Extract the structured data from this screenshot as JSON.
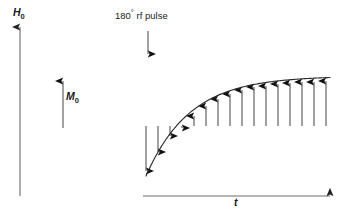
{
  "figure": {
    "kind": "nmr-inversion-recovery-diagram",
    "background_color": "#ffffff",
    "ink_color": "#1a1a1a",
    "shaft_color": "#555555",
    "axis_color": "#6b6b6b",
    "curve_color": "#2b2b2b",
    "labels": {
      "y_axis": "H",
      "y_axis_sub": "0",
      "magnetization": "M",
      "magnetization_sub": "0",
      "x_axis": "t",
      "pulse_prefix": "180",
      "pulse_degree": "°",
      "pulse_suffix": " rf pulse"
    }
  },
  "chart_data": {
    "type": "line",
    "title": "",
    "subtitle": "",
    "xlabel": "t",
    "ylabel": "H0",
    "grid": false,
    "legend": "none",
    "annotations": [
      {
        "text": "H0",
        "role": "y-axis-label",
        "x": 20,
        "y": 14
      },
      {
        "text": "M0",
        "role": "equilibrium-magnetization-label",
        "x": 72,
        "y": 96
      },
      {
        "text": "180° rf pulse",
        "role": "pulse-label",
        "x": 150,
        "y": 16
      },
      {
        "text": "t",
        "role": "x-axis-label",
        "x": 237,
        "y": 203
      }
    ],
    "axes": {
      "y_axis": {
        "x": 20,
        "y_bottom": 196,
        "y_top": 25,
        "arrow": "up"
      },
      "x_axis": {
        "y": 196,
        "x_left": 143,
        "x_right": 332,
        "arrow": "right"
      }
    },
    "reference_vector": {
      "name": "M0",
      "x": 63,
      "y_base": 128,
      "y_tip": 79,
      "direction": "up",
      "length_px": 49
    },
    "pulse_marker": {
      "name": "180-degree-rf-pulse",
      "x": 148,
      "y_top": 31,
      "y_tip": 56,
      "direction": "down"
    },
    "curve": {
      "description": "T1 inversion recovery: Mz(t) = M0 (1 - 2 exp(-t/T1))",
      "x_start": 146,
      "x_end": 330,
      "y_start": 176,
      "y_asymptote": 76,
      "equilibrium_level": 76,
      "inversion_level": 176,
      "zero_crossing_x": 176
    },
    "x": [
      146,
      158,
      170,
      182,
      194,
      206,
      218,
      230,
      242,
      254,
      266,
      278,
      290,
      302,
      314,
      326
    ],
    "values": [
      -1.0,
      -0.62,
      -0.3,
      0.06,
      0.3,
      0.5,
      0.64,
      0.74,
      0.82,
      0.87,
      0.9,
      0.93,
      0.95,
      0.965,
      0.975,
      0.985
    ],
    "ylim": [
      -1.0,
      1.0
    ],
    "vectors": [
      {
        "index": 0,
        "x": 146,
        "y_base": 126,
        "y_tip": 176,
        "direction": "down"
      },
      {
        "index": 1,
        "x": 158,
        "y_base": 126,
        "y_tip": 157,
        "direction": "down"
      },
      {
        "index": 2,
        "x": 170,
        "y_base": 126,
        "y_tip": 141,
        "direction": "down"
      },
      {
        "index": 3,
        "x": 182,
        "y_base": 126,
        "y_tip": 123,
        "direction": "up"
      },
      {
        "index": 4,
        "x": 194,
        "y_base": 126,
        "y_tip": 111,
        "direction": "up"
      },
      {
        "index": 5,
        "x": 206,
        "y_base": 126,
        "y_tip": 101,
        "direction": "up"
      },
      {
        "index": 6,
        "x": 218,
        "y_base": 126,
        "y_tip": 94,
        "direction": "up"
      },
      {
        "index": 7,
        "x": 230,
        "y_base": 126,
        "y_tip": 89,
        "direction": "up"
      },
      {
        "index": 8,
        "x": 242,
        "y_base": 126,
        "y_tip": 85,
        "direction": "up"
      },
      {
        "index": 9,
        "x": 254,
        "y_base": 126,
        "y_tip": 82,
        "direction": "up"
      },
      {
        "index": 10,
        "x": 266,
        "y_base": 126,
        "y_tip": 81,
        "direction": "up"
      },
      {
        "index": 11,
        "x": 278,
        "y_base": 126,
        "y_tip": 79,
        "direction": "up"
      },
      {
        "index": 12,
        "x": 290,
        "y_base": 126,
        "y_tip": 78,
        "direction": "up"
      },
      {
        "index": 13,
        "x": 302,
        "y_base": 126,
        "y_tip": 77,
        "direction": "up"
      },
      {
        "index": 14,
        "x": 314,
        "y_base": 126,
        "y_tip": 77,
        "direction": "up"
      },
      {
        "index": 15,
        "x": 326,
        "y_base": 126,
        "y_tip": 76,
        "direction": "up"
      }
    ]
  }
}
